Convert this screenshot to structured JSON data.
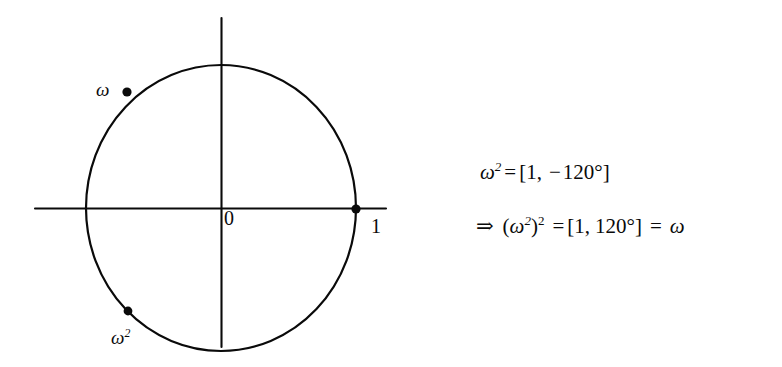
{
  "figure": {
    "background_color": "#ffffff",
    "ink_color": "#0a0a0a",
    "diagram": {
      "name": "unit-circle-cube-roots-of-unity",
      "center_label": "0",
      "real_unit_label": "1",
      "point_labels": {
        "omega": "ω",
        "omega_squared_base": "ω",
        "omega_squared_exponent": "2"
      },
      "geometry": {
        "center_x": 221,
        "center_y": 208,
        "radius_x": 135,
        "radius_y": 143,
        "x_axis_start_x": 35,
        "x_axis_end_x": 386,
        "y_axis_start_y": 18,
        "y_axis_end_y": 347
      },
      "marked_points": [
        {
          "label": "ω",
          "angle_deg": 120,
          "x": 127,
          "y": 92
        },
        {
          "label": "1",
          "angle_deg": 0,
          "x": 356,
          "y": 209
        },
        {
          "label": "ω²",
          "angle_deg": -120,
          "x": 128,
          "y": 311
        }
      ]
    },
    "equations": {
      "line1": {
        "var": "ω",
        "exponent": "2",
        "equals": "=",
        "open_bracket": "[",
        "modulus": "1",
        "comma": ",",
        "minus": "−",
        "angle": "120°",
        "close_bracket": "]"
      },
      "line2": {
        "implies": "⇒",
        "open_paren": "(",
        "var": "ω",
        "inner_exponent": "2",
        "close_paren": ")",
        "outer_exponent": "2",
        "equals": "=",
        "open_bracket": "[",
        "modulus": "1",
        "comma": ",",
        "angle": "120°",
        "close_bracket": "]",
        "equals2": "=",
        "result": "ω"
      }
    }
  }
}
